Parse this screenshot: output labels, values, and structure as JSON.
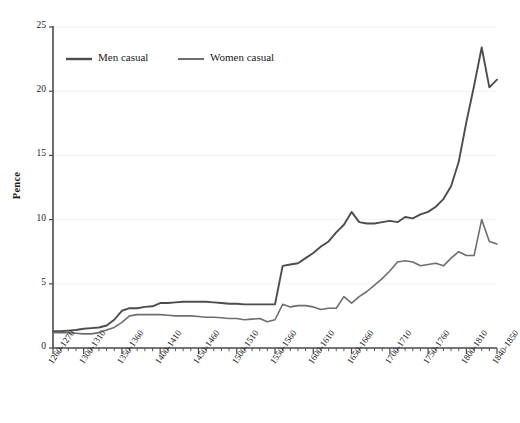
{
  "chart_data": {
    "type": "line",
    "title": "",
    "xlabel": "",
    "ylabel": "Pence",
    "ylim": [
      0,
      25
    ],
    "yticks": [
      0,
      5,
      10,
      15,
      20,
      25
    ],
    "grid": true,
    "grid_axis": "y",
    "legend_position": "top-left-inside",
    "x_tick_labels": [
      "1260-1270",
      "1300-1310",
      "1350-1360",
      "1400-1410",
      "1450-1460",
      "1500-1510",
      "1550-1560",
      "1600-1610",
      "1650-1660",
      "1700-1710",
      "1750-1760",
      "1800-1810",
      "1840-1850"
    ],
    "x_tick_indices": [
      0,
      4,
      9,
      14,
      19,
      24,
      29,
      34,
      39,
      44,
      49,
      54,
      58
    ],
    "x_minor_count": 59,
    "categories": [
      "1260-1270",
      "1270-1280",
      "1280-1290",
      "1290-1300",
      "1300-1310",
      "1310-1320",
      "1320-1330",
      "1330-1340",
      "1340-1350",
      "1350-1360",
      "1360-1370",
      "1370-1380",
      "1380-1390",
      "1390-1400",
      "1400-1410",
      "1410-1420",
      "1420-1430",
      "1430-1440",
      "1440-1450",
      "1450-1460",
      "1460-1470",
      "1470-1480",
      "1480-1490",
      "1490-1500",
      "1500-1510",
      "1510-1520",
      "1520-1530",
      "1530-1540",
      "1540-1550",
      "1550-1560",
      "1560-1570",
      "1570-1580",
      "1580-1590",
      "1590-1600",
      "1600-1610",
      "1610-1620",
      "1620-1630",
      "1630-1640",
      "1640-1650",
      "1650-1660",
      "1660-1670",
      "1670-1680",
      "1680-1690",
      "1690-1700",
      "1700-1710",
      "1710-1720",
      "1720-1730",
      "1730-1740",
      "1740-1750",
      "1750-1760",
      "1760-1770",
      "1770-1780",
      "1780-1790",
      "1790-1800",
      "1800-1810",
      "1810-1820",
      "1820-1830",
      "1830-1840",
      "1840-1850"
    ],
    "series": [
      {
        "name": "Men casual",
        "color": "#4d4d4d",
        "values": [
          1.3,
          1.3,
          1.35,
          1.4,
          1.5,
          1.55,
          1.6,
          1.75,
          2.2,
          2.9,
          3.1,
          3.1,
          3.2,
          3.25,
          3.5,
          3.5,
          3.55,
          3.6,
          3.6,
          3.6,
          3.6,
          3.55,
          3.5,
          3.45,
          3.45,
          3.4,
          3.4,
          3.4,
          3.4,
          3.4,
          6.4,
          6.5,
          6.6,
          7.0,
          7.4,
          7.9,
          8.3,
          9.0,
          9.6,
          10.6,
          9.8,
          9.7,
          9.7,
          9.8,
          9.9,
          9.8,
          10.2,
          10.1,
          10.4,
          10.6,
          11.0,
          11.6,
          12.6,
          14.5,
          17.6,
          20.4,
          23.4,
          20.3,
          20.9
        ]
      },
      {
        "name": "Women casual",
        "color": "#6e6e6e",
        "values": [
          1.2,
          1.2,
          1.2,
          1.15,
          1.1,
          1.1,
          1.2,
          1.4,
          1.6,
          2.0,
          2.5,
          2.6,
          2.6,
          2.6,
          2.6,
          2.55,
          2.5,
          2.5,
          2.5,
          2.45,
          2.4,
          2.4,
          2.35,
          2.3,
          2.3,
          2.2,
          2.25,
          2.3,
          2.05,
          2.2,
          3.4,
          3.2,
          3.3,
          3.3,
          3.2,
          3.0,
          3.1,
          3.1,
          4.0,
          3.5,
          4.0,
          4.4,
          4.9,
          5.4,
          6.0,
          6.7,
          6.8,
          6.7,
          6.4,
          6.5,
          6.6,
          6.4,
          7.0,
          7.5,
          7.2,
          7.2,
          10.0,
          8.3,
          8.1
        ]
      }
    ]
  },
  "legend": {
    "items": [
      {
        "label": "Men casual"
      },
      {
        "label": "Women casual"
      }
    ]
  },
  "axes": {
    "y_title": "Pence"
  }
}
